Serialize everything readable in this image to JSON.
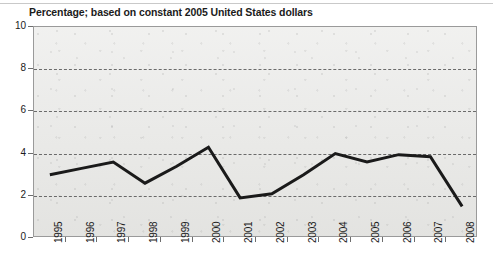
{
  "chart_data": {
    "type": "line",
    "title": "Percentage; based on constant 2005 United States dollars",
    "xlabel": "",
    "ylabel": "",
    "categories": [
      "1995",
      "1996",
      "1997",
      "1998",
      "1999",
      "2000",
      "2001",
      "2002",
      "2003",
      "2004",
      "2005",
      "2006",
      "2007",
      "2008"
    ],
    "values": [
      3.0,
      3.3,
      3.6,
      2.6,
      3.4,
      4.3,
      1.9,
      2.1,
      3.0,
      4.0,
      3.6,
      3.95,
      3.85,
      1.5
    ],
    "series": [
      {
        "name": "Percentage",
        "values": [
          3.0,
          3.3,
          3.6,
          2.6,
          3.4,
          4.3,
          1.9,
          2.1,
          3.0,
          4.0,
          3.6,
          3.95,
          3.85,
          1.5
        ]
      }
    ],
    "ylim": [
      0,
      10
    ],
    "y_ticks": [
      0,
      2,
      4,
      6,
      8,
      10
    ],
    "y_tick_labels": [
      "0",
      "2",
      "4",
      "6",
      "8",
      "10"
    ],
    "x_tick_labels": [
      "1995",
      "1996",
      "1997",
      "1998",
      "1999",
      "2000",
      "2001",
      "2002",
      "2003",
      "2004",
      "2005",
      "2006",
      "2007",
      "2008"
    ],
    "grid": true,
    "grid_style": "dashed-horizontal",
    "legend": false,
    "legend_position": "none",
    "line_color": "#1a1a1a",
    "line_width": 3,
    "plot_background": "#e9e9e7",
    "annotations": []
  },
  "axes": {
    "y_labels": [
      "10",
      "8",
      "6",
      "4",
      "2",
      "0"
    ],
    "x_labels": [
      "1995",
      "1996",
      "1997",
      "1998",
      "1999",
      "2000",
      "2001",
      "2002",
      "2003",
      "2004",
      "2005",
      "2006",
      "2007",
      "2008"
    ]
  }
}
